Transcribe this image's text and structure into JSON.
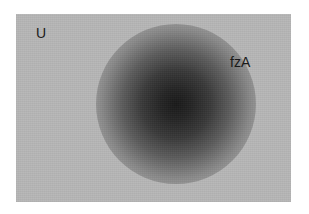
{
  "image": {
    "description": "Grayscale photograph of a diffuse dark spot on a light grey background",
    "labels": [
      {
        "id": "u",
        "text": "U"
      },
      {
        "id": "fza",
        "text": "fzA"
      }
    ],
    "colors": {
      "background": "#ffffff",
      "panel": "#b7b7b7",
      "spot_core": "#1a1a1a",
      "label_text": "#1a1a1a"
    }
  }
}
